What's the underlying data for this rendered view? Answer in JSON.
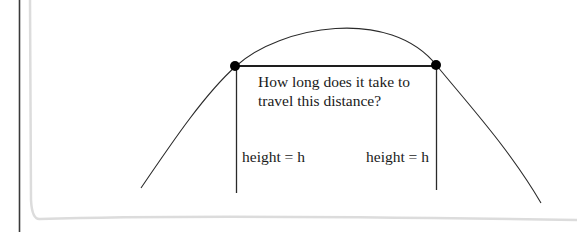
{
  "diagram": {
    "question_line1": "How long does it take to",
    "question_line2": "travel this distance?",
    "left_height_label": "height = h",
    "right_height_label": "height = h",
    "elements": {
      "trajectory": "parabolic arc",
      "points": [
        {
          "name": "left-point",
          "x": 235,
          "y": 66
        },
        {
          "name": "right-point",
          "x": 436,
          "y": 66
        }
      ],
      "distance_segment": "horizontal line connecting the two points",
      "height_markers": "vertical lines dropping from each point"
    },
    "colors": {
      "line": "#2a2a2a",
      "point": "#000000",
      "paper_edge": "#d8d8d8",
      "border": "#3a3a3a"
    }
  }
}
